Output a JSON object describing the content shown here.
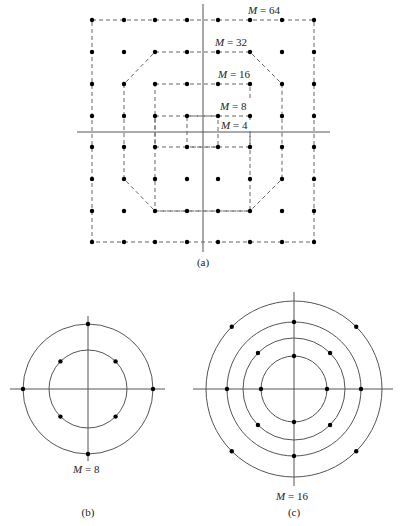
{
  "figure": {
    "panel_a": {
      "caption": "(a)",
      "grid_x": [
        92,
        124,
        155,
        187,
        218,
        250,
        282,
        314
      ],
      "grid_y": [
        20,
        52,
        84,
        116,
        147,
        179,
        211,
        242
      ],
      "axis": {
        "v_x": 203,
        "v_y1": 4,
        "v_y2": 252,
        "h_y": 132,
        "h_x1": 77,
        "h_x2": 330
      },
      "labels": [
        {
          "id": "m64",
          "var": "M",
          "text": " = 64",
          "x": 248,
          "y": 14
        },
        {
          "id": "m32",
          "var": "M",
          "text": " = 32",
          "x": 215,
          "y": 46
        },
        {
          "id": "m16",
          "var": "M",
          "text": " = 16",
          "x": 218,
          "y": 78
        },
        {
          "id": "m8",
          "var": "M",
          "text": " = 8",
          "x": 220,
          "y": 110
        },
        {
          "id": "m4",
          "var": "M",
          "text": " = 4",
          "x": 221,
          "y": 129
        }
      ],
      "boundaries": {
        "M64": [
          [
            92,
            20
          ],
          [
            314,
            20
          ],
          [
            314,
            242
          ],
          [
            92,
            242
          ]
        ],
        "M32": [
          [
            155,
            52
          ],
          [
            250,
            52
          ],
          [
            282,
            84
          ],
          [
            282,
            179
          ],
          [
            250,
            211
          ],
          [
            155,
            211
          ],
          [
            124,
            179
          ],
          [
            124,
            84
          ]
        ],
        "M16": [
          [
            155,
            84
          ],
          [
            250,
            84
          ],
          [
            250,
            211
          ],
          [
            155,
            211
          ]
        ],
        "M8": [
          [
            155,
            116
          ],
          [
            250,
            116
          ],
          [
            250,
            147
          ],
          [
            155,
            147
          ]
        ],
        "M4": [
          [
            187,
            116
          ],
          [
            218,
            116
          ],
          [
            218,
            147
          ],
          [
            187,
            147
          ]
        ]
      }
    },
    "panel_b": {
      "caption": "(b)",
      "label_var": "M",
      "label_text": " = 8",
      "center": [
        88,
        389
      ],
      "radii": [
        39,
        65
      ],
      "points_polar": [
        {
          "r": 39,
          "deg": 45
        },
        {
          "r": 39,
          "deg": 135
        },
        {
          "r": 39,
          "deg": 225
        },
        {
          "r": 39,
          "deg": 315
        },
        {
          "r": 65,
          "deg": 0
        },
        {
          "r": 65,
          "deg": 90
        },
        {
          "r": 65,
          "deg": 180
        },
        {
          "r": 65,
          "deg": 270
        }
      ],
      "axis": {
        "h_x1": 10,
        "h_x2": 165,
        "v_y1": 316,
        "v_y2": 461
      }
    },
    "panel_c": {
      "caption": "(c)",
      "label_var": "M",
      "label_text": " = 16",
      "center": [
        294,
        389
      ],
      "radii": [
        33,
        51,
        67,
        88
      ],
      "points_polar": [
        {
          "r": 33,
          "deg": 0
        },
        {
          "r": 33,
          "deg": 90
        },
        {
          "r": 33,
          "deg": 180
        },
        {
          "r": 33,
          "deg": 270
        },
        {
          "r": 51,
          "deg": 45
        },
        {
          "r": 51,
          "deg": 135
        },
        {
          "r": 51,
          "deg": 225
        },
        {
          "r": 51,
          "deg": 315
        },
        {
          "r": 67,
          "deg": 0
        },
        {
          "r": 67,
          "deg": 90
        },
        {
          "r": 67,
          "deg": 180
        },
        {
          "r": 67,
          "deg": 270
        },
        {
          "r": 88,
          "deg": 45
        },
        {
          "r": 88,
          "deg": 135
        },
        {
          "r": 88,
          "deg": 225
        },
        {
          "r": 88,
          "deg": 315
        }
      ],
      "axis": {
        "h_x1": 193,
        "h_x2": 393,
        "v_y1": 292,
        "v_y2": 486
      }
    }
  }
}
